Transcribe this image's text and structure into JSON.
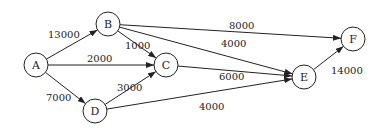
{
  "diagram": {
    "type": "directed-weighted-graph",
    "colors": {
      "stroke": "#222222",
      "background": "#ffffff",
      "text": "#222222"
    },
    "node_radius": 12,
    "nodes": [
      {
        "id": "A",
        "label": "A",
        "x": 36,
        "y": 65
      },
      {
        "id": "B",
        "label": "B",
        "x": 108,
        "y": 24
      },
      {
        "id": "C",
        "label": "C",
        "x": 166,
        "y": 65
      },
      {
        "id": "D",
        "label": "D",
        "x": 95,
        "y": 111
      },
      {
        "id": "E",
        "label": "E",
        "x": 304,
        "y": 77
      },
      {
        "id": "F",
        "label": "F",
        "x": 353,
        "y": 39
      }
    ],
    "edges": [
      {
        "from": "A",
        "to": "B",
        "weight": "13000",
        "lx": 48,
        "ly": 38
      },
      {
        "from": "A",
        "to": "C",
        "weight": "2000",
        "lx": 87,
        "ly": 62
      },
      {
        "from": "A",
        "to": "D",
        "weight": "7000",
        "lx": 46,
        "ly": 101
      },
      {
        "from": "B",
        "to": "C",
        "weight": "1000",
        "lx": 125,
        "ly": 49
      },
      {
        "from": "B",
        "to": "F",
        "weight": "8000",
        "lx": 229,
        "ly": 29
      },
      {
        "from": "B",
        "to": "E",
        "weight": "4000",
        "lx": 221,
        "ly": 47
      },
      {
        "from": "C",
        "to": "E",
        "weight": "6000",
        "lx": 219,
        "ly": 80
      },
      {
        "from": "D",
        "to": "C",
        "weight": "3000",
        "lx": 117,
        "ly": 91
      },
      {
        "from": "D",
        "to": "E",
        "weight": "4000",
        "lx": 199,
        "ly": 110
      },
      {
        "from": "E",
        "to": "F",
        "weight": "14000",
        "lx": 331,
        "ly": 74
      }
    ]
  }
}
